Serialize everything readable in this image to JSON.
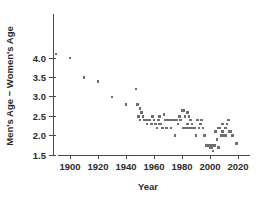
{
  "chart_data": {
    "type": "scatter",
    "title": "",
    "xlabel": "Year",
    "ylabel": "Men's Age − Women's Age",
    "xlim": [
      1885,
      2025
    ],
    "ylim": [
      1.45,
      4.15
    ],
    "xticks": [
      1900,
      1920,
      1940,
      1960,
      1980,
      2000,
      2020
    ],
    "xtick_labels": [
      "1900",
      "1920",
      "1940",
      "1960",
      "1980",
      "2000",
      "2020"
    ],
    "yticks": [
      1.5,
      2.0,
      2.5,
      3.0,
      3.5,
      4.0
    ],
    "ytick_labels": [
      "1.5",
      "2.0",
      "2.5",
      "3.0",
      "3.5",
      "4.0"
    ],
    "grid": false,
    "legend": null,
    "marker": "square",
    "marker_color": "#6e6e6e",
    "marker_size_px": 2.6,
    "points": [
      [
        1890,
        4.1
      ],
      [
        1900,
        4.0
      ],
      [
        1910,
        3.5
      ],
      [
        1920,
        3.4
      ],
      [
        1930,
        3.0
      ],
      [
        1940,
        2.8
      ],
      [
        1947,
        3.2
      ],
      [
        1948,
        2.8
      ],
      [
        1949,
        2.5
      ],
      [
        1950,
        2.7
      ],
      [
        1950,
        2.4
      ],
      [
        1951,
        2.6
      ],
      [
        1952,
        2.5
      ],
      [
        1953,
        2.4
      ],
      [
        1954,
        2.4
      ],
      [
        1955,
        2.3
      ],
      [
        1956,
        2.4
      ],
      [
        1957,
        2.4
      ],
      [
        1958,
        2.3
      ],
      [
        1959,
        2.5
      ],
      [
        1960,
        2.4
      ],
      [
        1961,
        2.3
      ],
      [
        1962,
        2.2
      ],
      [
        1963,
        2.4
      ],
      [
        1964,
        2.5
      ],
      [
        1964,
        2.3
      ],
      [
        1965,
        2.3
      ],
      [
        1966,
        2.2
      ],
      [
        1967,
        2.55
      ],
      [
        1968,
        2.4
      ],
      [
        1969,
        2.2
      ],
      [
        1970,
        2.4
      ],
      [
        1971,
        2.4
      ],
      [
        1972,
        2.2
      ],
      [
        1973,
        2.4
      ],
      [
        1974,
        2.4
      ],
      [
        1975,
        2.0
      ],
      [
        1976,
        2.4
      ],
      [
        1977,
        2.3
      ],
      [
        1978,
        2.5
      ],
      [
        1979,
        2.4
      ],
      [
        1980,
        2.65
      ],
      [
        1981,
        2.65
      ],
      [
        1981,
        2.2
      ],
      [
        1982,
        2.5
      ],
      [
        1983,
        2.2
      ],
      [
        1984,
        2.6
      ],
      [
        1984,
        2.3
      ],
      [
        1985,
        2.5
      ],
      [
        1985,
        2.2
      ],
      [
        1986,
        2.4
      ],
      [
        1986,
        2.2
      ],
      [
        1987,
        2.3
      ],
      [
        1988,
        2.2
      ],
      [
        1989,
        2.2
      ],
      [
        1990,
        2.0
      ],
      [
        1991,
        2.4
      ],
      [
        1992,
        2.2
      ],
      [
        1993,
        2.3
      ],
      [
        1994,
        2.4
      ],
      [
        1995,
        2.2
      ],
      [
        1996,
        2.0
      ],
      [
        1997,
        1.75
      ],
      [
        1998,
        1.75
      ],
      [
        1999,
        1.75
      ],
      [
        2000,
        1.75
      ],
      [
        2000,
        1.7
      ],
      [
        2001,
        1.75
      ],
      [
        2001,
        1.7
      ],
      [
        2002,
        1.6
      ],
      [
        2003,
        1.75
      ],
      [
        2004,
        2.1
      ],
      [
        2005,
        1.9
      ],
      [
        2006,
        2.2
      ],
      [
        2006,
        1.7
      ],
      [
        2007,
        2.2
      ],
      [
        2008,
        2.0
      ],
      [
        2009,
        2.3
      ],
      [
        2009,
        2.1
      ],
      [
        2010,
        2.0
      ],
      [
        2011,
        2.2
      ],
      [
        2011,
        2.0
      ],
      [
        2012,
        2.3
      ],
      [
        2013,
        2.4
      ],
      [
        2014,
        2.1
      ],
      [
        2015,
        2.1
      ],
      [
        2016,
        2.0
      ],
      [
        2019,
        1.8
      ]
    ]
  }
}
